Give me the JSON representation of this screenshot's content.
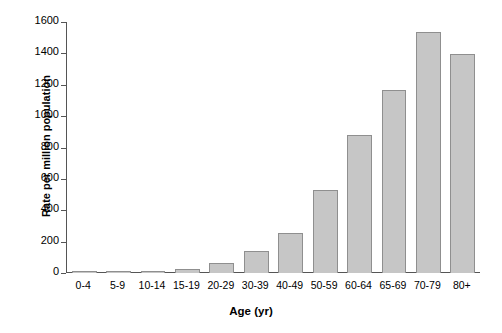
{
  "chart_data": {
    "type": "bar",
    "title": "",
    "xlabel": "Age (yr)",
    "ylabel": "Rate per million population",
    "categories": [
      "0-4",
      "5-9",
      "10-14",
      "15-19",
      "20-29",
      "30-39",
      "40-49",
      "50-59",
      "60-64",
      "65-69",
      "70-79",
      "80+"
    ],
    "values": [
      10,
      8,
      15,
      28,
      62,
      143,
      255,
      530,
      880,
      1165,
      1535,
      1395
    ],
    "ylim": [
      0,
      1600
    ],
    "yticks": [
      0,
      200,
      400,
      600,
      800,
      1000,
      1200,
      1400,
      1600
    ],
    "ytick_labels": [
      "0",
      "200",
      "400",
      "600",
      "800",
      "1000",
      "1200",
      "1400",
      "1600"
    ],
    "grid": false,
    "legend": false,
    "bar_fill_color": "#c6c6c6",
    "bar_edge_color": "#8f8f8f",
    "axis_color": "#555555",
    "background_color": "#ffffff"
  }
}
